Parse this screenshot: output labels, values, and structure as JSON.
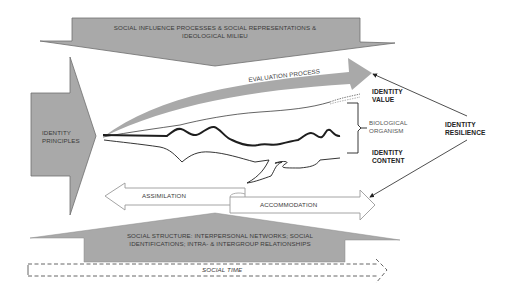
{
  "diagram": {
    "top_arrow": {
      "label_line1": "SOCIAL INFLUENCE PROCESSES & SOCIAL REPRESENTATIONS &",
      "label_line2": "IDEOLOGICAL MILIEU"
    },
    "left_arrow": {
      "label_line1": "IDENTITY",
      "label_line2": "PRINCIPLES"
    },
    "evaluation_arrow": {
      "label": "EVALUATION PROCESS"
    },
    "identity_value": {
      "line1": "IDENTITY",
      "line2": "VALUE"
    },
    "biological_organism": {
      "line1": "BIOLOGICAL",
      "line2": "ORGANISM"
    },
    "identity_content": {
      "line1": "IDENTITY",
      "line2": "CONTENT"
    },
    "identity_resilience": {
      "line1": "IDENTITY",
      "line2": "RESILIENCE"
    },
    "assimilation_arrow": {
      "label": "ASSIMILATION"
    },
    "accommodation_arrow": {
      "label": "ACCOMMODATION"
    },
    "bottom_arrow": {
      "label_line1": "SOCIAL STRUCTURE: INTERPERSONAL NETWORKS; SOCIAL",
      "label_line2": "IDENTIFICATIONS; INTRA- & INTERGROUP RELATIONSHIPS"
    },
    "time_arrow": {
      "label": "SOCIAL TIME"
    },
    "colors": {
      "arrow_fill": "#a9a9a9",
      "arrow_stroke": "#6e6e6e",
      "line": "#1e1e1e",
      "outline_arrow": "#9a9a9a"
    }
  }
}
